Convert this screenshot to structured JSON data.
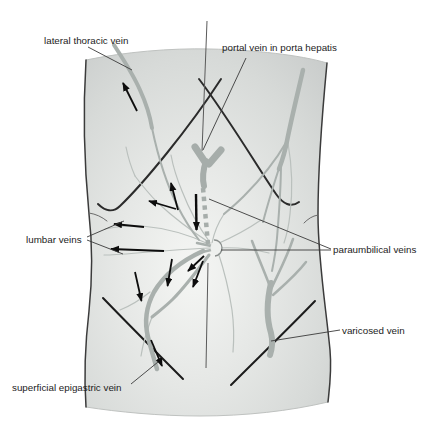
{
  "figure": {
    "kind": "anatomical-diagram",
    "labels": {
      "lateral_thoracic": "lateral thoracic vein",
      "portal": "portal vein in porta hepatis",
      "lumbar": "lumbar veins",
      "paraumbilical": "paraumbilical veins",
      "varicosed": "varicosed vein",
      "superficial_epigastric": "superficial epigastric vein"
    }
  },
  "colors": {
    "background": "#ffffff",
    "skin_light": "#f5f6f4",
    "skin_mid": "#dcdedc",
    "skin_dark": "#c8cbca",
    "vein_thick": "#a9b0ad",
    "vein_thin": "#bac0bd",
    "outline": "#3b3b3b",
    "crease": "#1c1c1c",
    "arrow": "#0d0d0d",
    "leader": "#3a3a3a",
    "label_text": "#1c1c1c"
  }
}
